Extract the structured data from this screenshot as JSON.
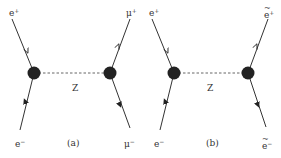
{
  "colors": {
    "line": "#333333",
    "vertex": "#222222",
    "text": "#333333",
    "background": "#ffffff"
  },
  "diagrams": [
    {
      "id": "a",
      "caption": "(a)",
      "propagator": "Z",
      "incoming_top": {
        "symbol": "e",
        "charge": "+"
      },
      "incoming_bottom": {
        "symbol": "e",
        "charge": "−"
      },
      "outgoing_top": {
        "symbol": "μ",
        "charge": "+"
      },
      "outgoing_bottom": {
        "symbol": "μ",
        "charge": "−"
      }
    },
    {
      "id": "b",
      "caption": "(b)",
      "propagator": "Z",
      "incoming_top": {
        "symbol": "e",
        "charge": "+"
      },
      "incoming_bottom": {
        "symbol": "e",
        "charge": "−"
      },
      "outgoing_top": {
        "symbol": "e",
        "charge": "+",
        "tilde": true
      },
      "outgoing_bottom": {
        "symbol": "e",
        "charge": "−",
        "tilde": true
      }
    }
  ]
}
